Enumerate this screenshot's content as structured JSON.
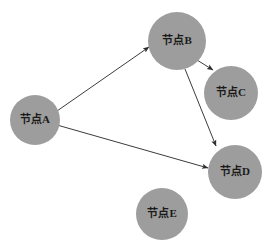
{
  "diagram": {
    "background_color": "#ffffff",
    "node_fill_color": "#9d9d9d",
    "node_text_color": "#1a1a1a",
    "edge_color": "#3c3c3c",
    "nodes": [
      {
        "id": "A",
        "label": "节点A",
        "cx": 35,
        "cy": 120,
        "r": 25
      },
      {
        "id": "B",
        "label": "节点B",
        "cx": 177,
        "cy": 41,
        "r": 29
      },
      {
        "id": "C",
        "label": "节点C",
        "cx": 231,
        "cy": 93,
        "r": 27
      },
      {
        "id": "D",
        "label": "节点D",
        "cx": 235,
        "cy": 172,
        "r": 27
      },
      {
        "id": "E",
        "label": "节点E",
        "cx": 162,
        "cy": 214,
        "r": 26
      }
    ],
    "edges": [
      {
        "id": "A-B",
        "from": "A",
        "to": "B",
        "x1": 57,
        "y1": 111,
        "x2": 149,
        "y2": 47,
        "directed": true
      },
      {
        "id": "A-D",
        "from": "A",
        "to": "D",
        "x1": 57,
        "y1": 125,
        "x2": 208,
        "y2": 168,
        "directed": true
      },
      {
        "id": "B-C",
        "from": "B",
        "to": "C",
        "x1": 197,
        "y1": 60,
        "x2": 213,
        "y2": 70,
        "directed": true
      },
      {
        "id": "B-D",
        "from": "B",
        "to": "D",
        "x1": 185,
        "y1": 69,
        "x2": 216,
        "y2": 146,
        "directed": true
      }
    ]
  }
}
